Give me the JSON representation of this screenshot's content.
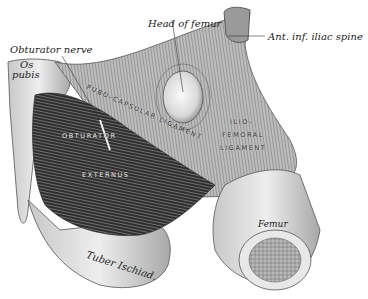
{
  "figure": {
    "colors": {
      "background": "#ffffff",
      "ink": "#222222",
      "bone": "#e6e6e6",
      "muscle": "#3a3a3a",
      "marrow": "#9a9a9a"
    }
  },
  "labels": {
    "head_of_femur": "Head of femur",
    "obturator_nerve": "Obturator nerve",
    "ant_inf_iliac_spine": "Ant. inf. iliac spine",
    "os_pubis_line1": "Os",
    "os_pubis_line2": "pubis",
    "pubo_capsular_ligament": "PUBO-CAPSULAR LIGAMENT",
    "obturator": "OBTURATOR",
    "externus": "EXTERNUS",
    "ilio": "ILIO-",
    "femoral": "FEMORAL",
    "ligament": "LIGAMENT",
    "femur": "Femur",
    "tuber_ischiad": "Tuber Ischiad."
  }
}
